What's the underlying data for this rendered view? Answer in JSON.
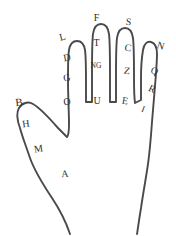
{
  "diagram": {
    "background_color": "#ffffff",
    "outline_color": "#4a4a4a",
    "label_color": "#2e2e2e",
    "parts": [
      {
        "part": "thumb",
        "labels": [
          "B",
          "H",
          "M"
        ]
      },
      {
        "part": "index-finger",
        "labels": [
          "L",
          "D",
          "G",
          "O"
        ]
      },
      {
        "part": "middle-finger",
        "labels": [
          "F",
          "T",
          "NG",
          "U"
        ]
      },
      {
        "part": "ring-finger",
        "labels": [
          "S",
          "C",
          "Z",
          "E"
        ]
      },
      {
        "part": "little-finger",
        "labels": [
          "N",
          "Q",
          "R",
          "I"
        ]
      },
      {
        "part": "palm",
        "labels": [
          "A"
        ]
      }
    ]
  },
  "labels": {
    "thumb_tip": "B",
    "thumb_upper": "H",
    "thumb_lower": "M",
    "index_tip": "L",
    "index_upper": "D",
    "index_middle": "G",
    "index_base": "O",
    "middle_tip": "F",
    "middle_upper": "T",
    "middle_middle": "NG",
    "middle_base": "U",
    "ring_tip": "S",
    "ring_upper": "C",
    "ring_middle": "Z",
    "ring_base": "E",
    "little_tip": "N",
    "little_upper": "Q",
    "little_middle": "R",
    "little_base": "I",
    "palm": "A"
  }
}
